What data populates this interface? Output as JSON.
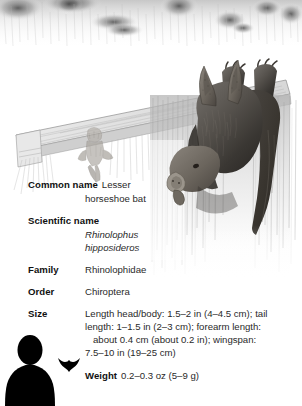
{
  "illustration": {
    "alt": "pencil drawing of a lesser horseshoe bat hanging upside down from a wooden beam in a cave, with a second bat in the background",
    "icon": "bat-hanging-illustration"
  },
  "facts": {
    "common_name": {
      "label": "Common name",
      "value_line1": "Lesser",
      "value_line2": "horseshoe bat"
    },
    "scientific_name": {
      "label": "Scientific name",
      "value_line1": "Rhinolophus",
      "value_line2": "hipposideros"
    },
    "family": {
      "label": "Family",
      "value": "Rhinolophidae"
    },
    "order": {
      "label": "Order",
      "value": "Chiroptera"
    },
    "size": {
      "label": "Size",
      "line1": "Length head/body: 1.5–2 in (4–4.5 cm); tail",
      "line2": "length: 1–1.5 in (2–3 cm); forearm length:",
      "line3": "about 0.4 cm (about 0.2 in); wingspan:",
      "line4": "7.5–10 in (19–25 cm)"
    },
    "weight": {
      "label": "Weight",
      "value": "0.2–0.3 oz (5–9 g)"
    }
  },
  "scale": {
    "human_icon": "human-silhouette",
    "bat_icon": "bat-silhouette"
  },
  "colors": {
    "text": "#1a1a1a",
    "value_text": "#2a2a2a",
    "silhouette": "#000000",
    "background": "#ffffff"
  }
}
